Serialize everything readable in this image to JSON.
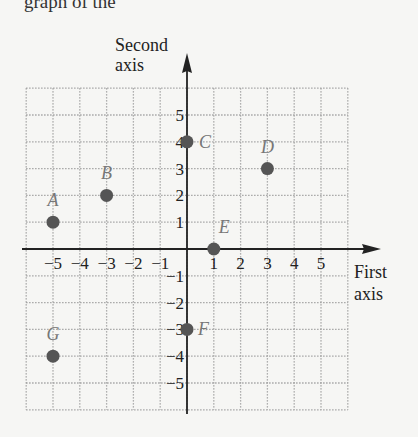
{
  "chart_data": {
    "type": "scatter",
    "title": "",
    "top_caption_fragment": "graph of the",
    "xlabel": "First axis",
    "xlabel_lines": [
      "First",
      "axis"
    ],
    "ylabel": "Second axis",
    "ylabel_lines": [
      "Second",
      "axis"
    ],
    "xlim": [
      -6,
      6
    ],
    "ylim": [
      -6,
      6
    ],
    "grid": true,
    "grid_style": "dotted",
    "x_ticks": [
      -5,
      -4,
      -3,
      -2,
      -1,
      1,
      2,
      3,
      4,
      5
    ],
    "y_ticks": [
      -5,
      -4,
      -3,
      -2,
      -1,
      1,
      2,
      3,
      4,
      5
    ],
    "x_tick_labels": [
      "−5",
      "−4",
      "−3",
      "−2",
      "−1",
      "1",
      "2",
      "3",
      "4",
      "5"
    ],
    "y_tick_labels": [
      "−5",
      "−4",
      "−3",
      "−2",
      "−1",
      "1",
      "2",
      "3",
      "4",
      "5"
    ],
    "points": [
      {
        "label": "A",
        "x": -5,
        "y": 1
      },
      {
        "label": "B",
        "x": -3,
        "y": 2
      },
      {
        "label": "C",
        "x": 0,
        "y": 4
      },
      {
        "label": "D",
        "x": 3,
        "y": 3
      },
      {
        "label": "E",
        "x": 1,
        "y": 0
      },
      {
        "label": "F",
        "x": 0,
        "y": -3
      },
      {
        "label": "G",
        "x": -5,
        "y": -4
      }
    ],
    "colors": {
      "point": "#555555",
      "point_label": "#777777",
      "axis": "#222222",
      "grid": "#999999",
      "background": "#f6f6f4"
    }
  }
}
